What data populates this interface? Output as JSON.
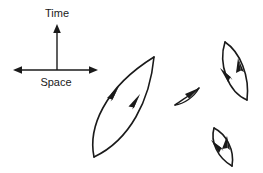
{
  "figure": {
    "title": "",
    "background_color": "#ffffff",
    "stroke_color": "#1a1a1a"
  },
  "axes": {
    "vertical": {
      "label": "Time",
      "label_x": 57,
      "label_y": 14,
      "x": 57,
      "y_top": 26,
      "y_bottom": 70,
      "arrow_direction": "up"
    },
    "horizontal": {
      "label": "Space",
      "label_x": 56,
      "label_y": 82,
      "y": 70,
      "x_left": 14,
      "x_right": 97,
      "arrow_direction": "both"
    }
  },
  "loops": [
    {
      "name": "large-tilted-lens",
      "tip_bottom_x": 94,
      "tip_bottom_y": 157,
      "tip_top_x": 154,
      "tip_top_y": 57,
      "width": 26,
      "stroke_width": 1.5,
      "arrow_count": 2,
      "arrow_direction": "counterclockwise-upward"
    },
    {
      "name": "small-middle-lens",
      "tip_bottom_x": 175,
      "tip_bottom_y": 105,
      "tip_top_x": 199,
      "tip_top_y": 88,
      "width": 7,
      "stroke_width": 1.3,
      "arrow_count": 1,
      "arrow_direction": "up-right"
    },
    {
      "name": "right-upper-lens",
      "tip_bottom_x": 247,
      "tip_bottom_y": 100,
      "tip_top_x": 225,
      "tip_top_y": 42,
      "width": 15,
      "stroke_width": 1.5,
      "arrow_count": 2,
      "arrow_direction": "upward"
    },
    {
      "name": "right-lower-lens",
      "tip_bottom_x": 232,
      "tip_bottom_y": 166,
      "tip_top_x": 214,
      "tip_top_y": 128,
      "width": 11,
      "stroke_width": 1.5,
      "arrow_count": 2,
      "arrow_direction": "upward"
    }
  ]
}
